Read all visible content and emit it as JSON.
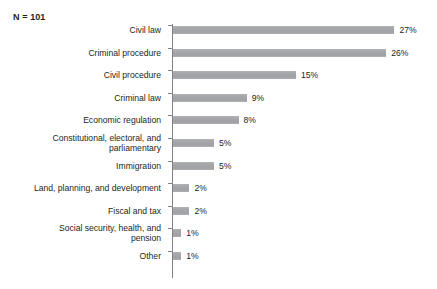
{
  "caption": {
    "sample_size_label": "N = 101"
  },
  "axis": {
    "line_color": "#808285"
  },
  "style": {
    "bar_color": "#a6a8ab",
    "text_color": "#231f20",
    "background_color": "#ffffff"
  },
  "chart_data": {
    "type": "bar",
    "orientation": "horizontal",
    "title": "",
    "subtitle": "",
    "xlabel": "",
    "ylabel": "",
    "annotations": [
      "N = 101"
    ],
    "grid": false,
    "legend": null,
    "xlim": [
      0,
      30
    ],
    "value_suffix": "%",
    "categories": [
      "Civil law",
      "Criminal procedure",
      "Civil procedure",
      "Criminal law",
      "Economic regulation",
      "Constitutional, electoral, and parliamentary",
      "Immigration",
      "Land, planning, and development",
      "Fiscal and tax",
      "Social security, health, and pension",
      "Other"
    ],
    "values": [
      27,
      26,
      15,
      9,
      8,
      5,
      5,
      2,
      2,
      1,
      1
    ],
    "data_labels": [
      "27%",
      "26%",
      "15%",
      "9%",
      "8%",
      "5%",
      "5%",
      "2%",
      "2%",
      "1%",
      "1%"
    ]
  },
  "rows": [
    {
      "label": "Civil law",
      "label_lines": "Civil law",
      "value": 27,
      "data_label": "27%"
    },
    {
      "label": "Criminal procedure",
      "label_lines": "Criminal procedure",
      "value": 26,
      "data_label": "26%"
    },
    {
      "label": "Civil procedure",
      "label_lines": "Civil procedure",
      "value": 15,
      "data_label": "15%"
    },
    {
      "label": "Criminal law",
      "label_lines": "Criminal law",
      "value": 9,
      "data_label": "9%"
    },
    {
      "label": "Economic regulation",
      "label_lines": "Economic regulation",
      "value": 8,
      "data_label": "8%"
    },
    {
      "label": "Constitutional, electoral, and parliamentary",
      "label_lines": "Constitutional, electoral, and\nparliamentary",
      "value": 5,
      "data_label": "5%"
    },
    {
      "label": "Immigration",
      "label_lines": "Immigration",
      "value": 5,
      "data_label": "5%"
    },
    {
      "label": "Land, planning, and development",
      "label_lines": "Land, planning, and development",
      "value": 2,
      "data_label": "2%"
    },
    {
      "label": "Fiscal and tax",
      "label_lines": "Fiscal and tax",
      "value": 2,
      "data_label": "2%"
    },
    {
      "label": "Social security, health, and pension",
      "label_lines": "Social security, health, and\npension",
      "value": 1,
      "data_label": "1%"
    },
    {
      "label": "Other",
      "label_lines": "Other",
      "value": 1,
      "data_label": "1%"
    }
  ]
}
